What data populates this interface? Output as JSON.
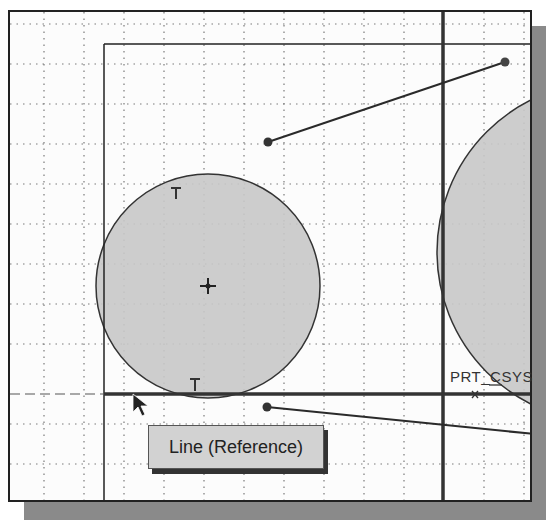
{
  "sketch": {
    "grid": {
      "spacing": 40,
      "color": "#7a7a7a"
    },
    "colors": {
      "fill": "#c8c8c8",
      "stroke": "#333333",
      "line": "#2a2a2a",
      "background": "#fcfcfc",
      "shadow": "#8a8a8a"
    },
    "circles": [
      {
        "name": "small-circle",
        "cx": 206,
        "cy": 284,
        "r": 112
      },
      {
        "name": "large-circle",
        "cx": 605,
        "cy": 250,
        "r": 170
      }
    ],
    "lines": [
      {
        "name": "upper-line",
        "x1": 266,
        "y1": 140,
        "x2": 503,
        "y2": 60
      },
      {
        "name": "lower-line",
        "x1": 265,
        "y1": 405,
        "x2": 532,
        "y2": 432
      }
    ],
    "tangent_markers": [
      "T",
      "T"
    ],
    "reference_lines": {
      "vertical_x": 441,
      "horizontal_y": 392
    },
    "coordinate_system_label": "PRT_CSYS"
  },
  "tooltip": {
    "text": "Line (Reference)"
  }
}
